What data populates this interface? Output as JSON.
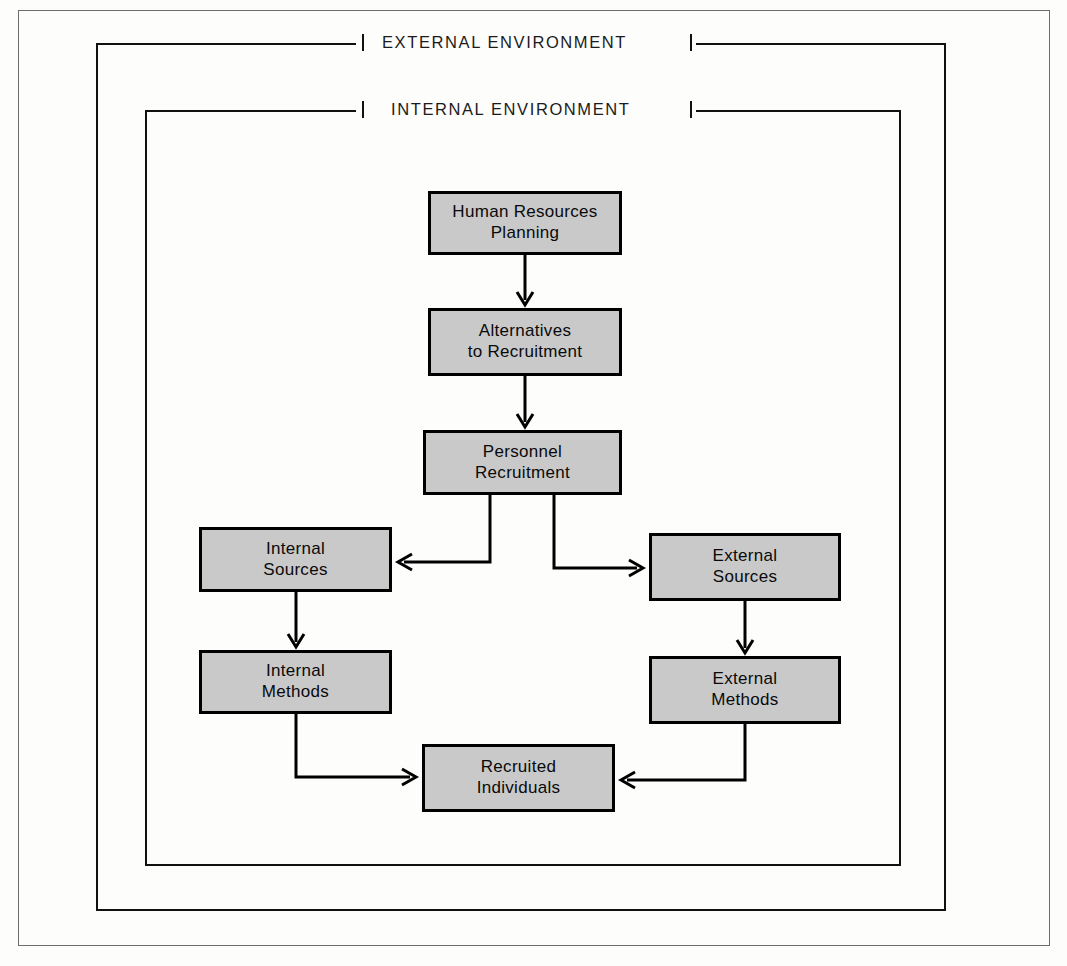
{
  "diagram": {
    "frames": [
      {
        "id": "external",
        "label": "EXTERNAL ENVIRONMENT"
      },
      {
        "id": "internal",
        "label": "INTERNAL ENVIRONMENT"
      }
    ],
    "node_fill": "#c9c9c9",
    "node_stroke": "#000000",
    "nodes": [
      {
        "id": "hr-planning",
        "line1": "Human Resources",
        "line2": "Planning"
      },
      {
        "id": "alternatives",
        "line1": "Alternatives",
        "line2": "to Recruitment"
      },
      {
        "id": "personnel",
        "line1": "Personnel",
        "line2": "Recruitment"
      },
      {
        "id": "internal-sources",
        "line1": "Internal",
        "line2": "Sources"
      },
      {
        "id": "external-sources",
        "line1": "External",
        "line2": "Sources"
      },
      {
        "id": "internal-methods",
        "line1": "Internal",
        "line2": "Methods"
      },
      {
        "id": "external-methods",
        "line1": "External",
        "line2": "Methods"
      },
      {
        "id": "recruited",
        "line1": "Recruited",
        "line2": "Individuals"
      }
    ],
    "edges": [
      {
        "from": "hr-planning",
        "to": "alternatives",
        "arrow": "down"
      },
      {
        "from": "alternatives",
        "to": "personnel",
        "arrow": "down"
      },
      {
        "from": "personnel",
        "to": "internal-sources",
        "arrow": "left"
      },
      {
        "from": "personnel",
        "to": "external-sources",
        "arrow": "right"
      },
      {
        "from": "internal-sources",
        "to": "internal-methods",
        "arrow": "down"
      },
      {
        "from": "external-sources",
        "to": "external-methods",
        "arrow": "down"
      },
      {
        "from": "internal-methods",
        "to": "recruited",
        "arrow": "right"
      },
      {
        "from": "external-methods",
        "to": "recruited",
        "arrow": "left"
      }
    ]
  }
}
